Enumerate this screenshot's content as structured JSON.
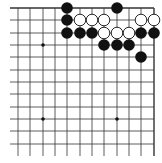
{
  "diagram": {
    "type": "go-board-fragment",
    "corner": "top-right",
    "columns_x": [
      18,
      30,
      43,
      55,
      67,
      80,
      92,
      104,
      117,
      129,
      141,
      154
    ],
    "rows_y": [
      8,
      20,
      33,
      45,
      57,
      70,
      82,
      94,
      107,
      119,
      131,
      144
    ],
    "line_extent": {
      "left": 10,
      "right": 154,
      "top": 8,
      "bottom": 156
    },
    "star_points": [
      [
        2,
        3
      ],
      [
        2,
        9
      ],
      [
        8,
        9
      ]
    ],
    "stones": [
      {
        "color": "black",
        "col": 4,
        "row": 0
      },
      {
        "color": "black",
        "col": 8,
        "row": 0
      },
      {
        "color": "black",
        "col": 4,
        "row": 1
      },
      {
        "color": "white",
        "col": 5,
        "row": 1
      },
      {
        "color": "white",
        "col": 6,
        "row": 1
      },
      {
        "color": "white",
        "col": 7,
        "row": 1
      },
      {
        "color": "white",
        "col": 10,
        "row": 1
      },
      {
        "color": "white",
        "col": 11,
        "row": 1
      },
      {
        "color": "black",
        "col": 4,
        "row": 2
      },
      {
        "color": "black",
        "col": 5,
        "row": 2
      },
      {
        "color": "black",
        "col": 6,
        "row": 2
      },
      {
        "color": "white",
        "col": 7,
        "row": 2
      },
      {
        "color": "white",
        "col": 8,
        "row": 2
      },
      {
        "color": "white",
        "col": 9,
        "row": 2
      },
      {
        "color": "black",
        "col": 10,
        "row": 2
      },
      {
        "color": "black",
        "col": 11,
        "row": 2
      },
      {
        "color": "black",
        "col": 7,
        "row": 3
      },
      {
        "color": "black",
        "col": 8,
        "row": 3
      },
      {
        "color": "black",
        "col": 9,
        "row": 3
      },
      {
        "color": "black",
        "col": 10,
        "row": 4
      }
    ],
    "colors": {
      "line": "#333333",
      "black_stone": "#111111",
      "white_stone": "#ffffff",
      "star": "#111111"
    }
  }
}
